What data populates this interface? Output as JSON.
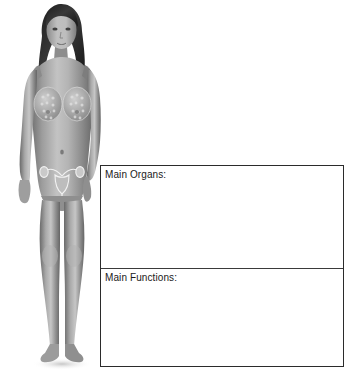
{
  "page": {
    "background_color": "#ffffff",
    "width": 356,
    "height": 389
  },
  "figure": {
    "name": "female-reproductive-system-figure",
    "highlighted_structures": [
      "mammary-glands",
      "ovaries",
      "fallopian-tubes",
      "uterus",
      "vagina"
    ],
    "skin_tone": "#9b9b9b",
    "hair_color": "#2d2d2d",
    "outline_color": "#6e6e6e"
  },
  "answer_box": {
    "border_color": "#2b2b2b",
    "divider_color": "#3a3a3a",
    "fill_color": "#ffffff",
    "sections": [
      {
        "id": "main-organs",
        "label": "Main Organs:",
        "value": ""
      },
      {
        "id": "main-functions",
        "label": "Main Functions:",
        "value": ""
      }
    ]
  },
  "caption": {
    "text": ""
  }
}
